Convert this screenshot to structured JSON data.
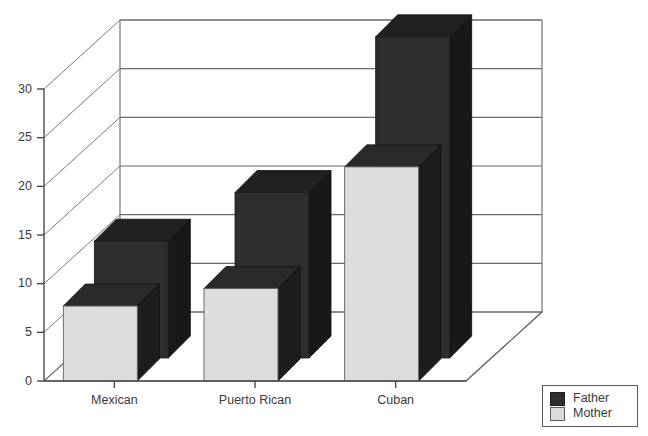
{
  "chart_data": {
    "type": "bar",
    "title": "",
    "subtitle": "",
    "xlabel": "",
    "ylabel": "",
    "categories": [
      "Mexican",
      "Puerto Rican",
      "Cuban"
    ],
    "series": [
      {
        "name": "Father",
        "values": [
          12,
          17,
          33
        ],
        "color": "#2e2e2e"
      },
      {
        "name": "Mother",
        "values": [
          7.7,
          9.5,
          22
        ],
        "color": "#dcdcdc"
      }
    ],
    "yticks": [
      0,
      5,
      10,
      15,
      20,
      25,
      30
    ],
    "ytick_labels": [
      "0",
      "5",
      "10",
      "15",
      "20",
      "25",
      "30"
    ],
    "ylim": [
      0,
      35
    ],
    "grid": true,
    "three_d": true,
    "legend_position": "bottom-right",
    "legend_entries": [
      "Father",
      "Mother"
    ]
  },
  "legend": {
    "entries": [
      {
        "label": "Father",
        "swatch": "dark-swatch"
      },
      {
        "label": "Mother",
        "swatch": "light-swatch"
      }
    ]
  },
  "colors": {
    "father": "#2e2e2e",
    "mother": "#dcdcdc",
    "axis": "#4a4a4a",
    "grid": "#6b6b6b",
    "background": "#ffffff"
  }
}
